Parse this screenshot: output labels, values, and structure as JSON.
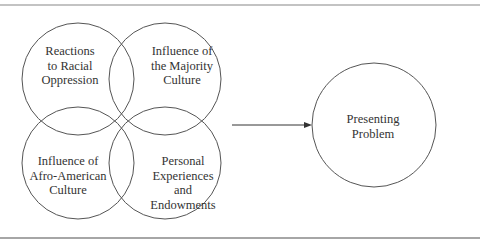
{
  "diagram": {
    "colors": {
      "stroke": "#555555",
      "rule": "#888888",
      "text": "#333333"
    },
    "circles": [
      {
        "id": "racial-oppression",
        "lines": [
          "Reactions",
          "to Racial",
          "Oppression"
        ]
      },
      {
        "id": "majority-culture",
        "lines": [
          "Influence of",
          "the Majority",
          "Culture"
        ]
      },
      {
        "id": "afro-american-culture",
        "lines": [
          "Influence of",
          "Afro-American",
          "Culture"
        ]
      },
      {
        "id": "personal-experiences",
        "lines": [
          "Personal",
          "Experiences",
          "and",
          "Endowments"
        ]
      }
    ],
    "outcome": {
      "id": "presenting-problem",
      "lines": [
        "Presenting",
        "Problem"
      ]
    },
    "arrow": {
      "from": "overlapping-circles",
      "to": "presenting-problem"
    }
  }
}
